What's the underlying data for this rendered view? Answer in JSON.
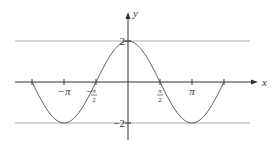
{
  "chart_data": {
    "type": "line",
    "title": "",
    "function": "y = 2cos(x)",
    "xlabel": "x",
    "ylabel": "y",
    "xlim": [
      -4.712,
      4.712
    ],
    "ylim": [
      -2,
      2
    ],
    "x_ticks": [
      {
        "value": -3.14159,
        "label": "−π"
      },
      {
        "value": -1.5708,
        "label": "−π/2",
        "num": "π",
        "den": "2",
        "sign": "−"
      },
      {
        "value": 1.5708,
        "label": "π/2",
        "num": "π",
        "den": "2"
      },
      {
        "value": 3.14159,
        "label": "π"
      }
    ],
    "extra_ticks": [
      -4.712,
      4.712
    ],
    "y_ticks": [
      {
        "value": 2,
        "label": "2"
      },
      {
        "value": -2,
        "label": "−2"
      }
    ],
    "reference_lines": [
      2,
      -2
    ],
    "series": [
      {
        "name": "2cos(x)",
        "x_range": [
          -4.712,
          4.712
        ],
        "amplitude": 2
      }
    ],
    "grid": false,
    "legend": "none",
    "colors": {
      "curve": "#555555",
      "axis": "#333333",
      "ref": "#aaaaaa"
    }
  }
}
